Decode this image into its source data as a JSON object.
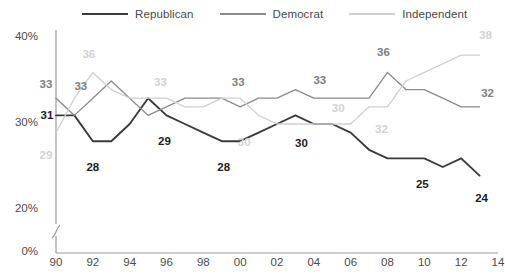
{
  "chart_data": {
    "type": "line",
    "title": "",
    "subtitle": "",
    "xlabel": "",
    "ylabel": "",
    "x": [
      1990,
      1991,
      1992,
      1993,
      1994,
      1995,
      1996,
      1997,
      1998,
      1999,
      2000,
      2001,
      2002,
      2003,
      2004,
      2005,
      2006,
      2007,
      2008,
      2009,
      2010,
      2011,
      2012,
      2013
    ],
    "xtick_labels": [
      "90",
      "92",
      "94",
      "96",
      "98",
      "00",
      "02",
      "04",
      "06",
      "08",
      "10",
      "12",
      "14"
    ],
    "xtick_values": [
      1990,
      1992,
      1994,
      1996,
      1998,
      2000,
      2002,
      2004,
      2006,
      2008,
      2010,
      2012,
      2014
    ],
    "ytick_labels": [
      "40%",
      "30%",
      "20%",
      "0%"
    ],
    "ytick_values": [
      40,
      30,
      20,
      0
    ],
    "ylim": [
      20,
      41
    ],
    "xlim": [
      1990,
      2014
    ],
    "grid": false,
    "axis_break": true,
    "legend_position": "top",
    "series": [
      {
        "name": "Republican",
        "color": "#3a3a3a",
        "values": [
          31,
          31,
          28,
          28,
          30,
          33,
          31,
          30,
          29,
          28,
          28,
          29,
          30,
          31,
          30,
          30,
          29,
          27,
          26,
          26,
          26,
          25,
          26,
          24
        ]
      },
      {
        "name": "Democrat",
        "color": "#8a8a8a",
        "values": [
          33,
          31,
          33,
          35,
          33,
          31,
          32,
          33,
          33,
          33,
          32,
          33,
          33,
          34,
          33,
          33,
          33,
          33,
          36,
          34,
          34,
          33,
          32,
          32
        ]
      },
      {
        "name": "Independent",
        "color": "#d0d0d0",
        "values": [
          29,
          33,
          36,
          34,
          33,
          33,
          33,
          32,
          32,
          33,
          33,
          31,
          30,
          30,
          30,
          30,
          30,
          32,
          32,
          35,
          36,
          37,
          38,
          38
        ]
      }
    ],
    "annotations": [
      {
        "text": "31",
        "series": "Republican",
        "x": 1990,
        "y": 31
      },
      {
        "text": "28",
        "series": "Republican",
        "x": 1992,
        "y": 28
      },
      {
        "text": "29",
        "series": "Republican",
        "x": 1996,
        "y": 31
      },
      {
        "text": "28",
        "series": "Republican",
        "x": 1999,
        "y": 28
      },
      {
        "text": "30",
        "series": "Republican",
        "x": 2003,
        "y": 31
      },
      {
        "text": "25",
        "series": "Republican",
        "x": 2010,
        "y": 26
      },
      {
        "text": "24",
        "series": "Republican",
        "x": 2013,
        "y": 24
      },
      {
        "text": "33",
        "series": "Democrat",
        "x": 1990,
        "y": 33
      },
      {
        "text": "33",
        "series": "Democrat",
        "x": 1992,
        "y": 33
      },
      {
        "text": "33",
        "series": "Democrat",
        "x": 2000,
        "y": 33
      },
      {
        "text": "33",
        "series": "Democrat",
        "x": 2004,
        "y": 33
      },
      {
        "text": "36",
        "series": "Democrat",
        "x": 2008,
        "y": 36
      },
      {
        "text": "32",
        "series": "Democrat",
        "x": 2013,
        "y": 32
      },
      {
        "text": "29",
        "series": "Independent",
        "x": 1990,
        "y": 29
      },
      {
        "text": "36",
        "series": "Independent",
        "x": 1992,
        "y": 36
      },
      {
        "text": "33",
        "series": "Independent",
        "x": 1996,
        "y": 33
      },
      {
        "text": "30",
        "series": "Independent",
        "x": 2000,
        "y": 30
      },
      {
        "text": "30",
        "series": "Independent",
        "x": 2005,
        "y": 30
      },
      {
        "text": "32",
        "series": "Independent",
        "x": 2008,
        "y": 32
      },
      {
        "text": "38",
        "series": "Independent",
        "x": 2013,
        "y": 38
      }
    ]
  },
  "legend": {
    "entries": [
      {
        "label": "Republican",
        "color": "#3a3a3a"
      },
      {
        "label": "Democrat",
        "color": "#8a8a8a"
      },
      {
        "label": "Independent",
        "color": "#d0d0d0"
      }
    ]
  }
}
